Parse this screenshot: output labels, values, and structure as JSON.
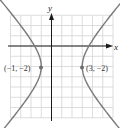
{
  "chart_data": {
    "type": "line",
    "title": "",
    "xlabel": "x",
    "ylabel": "y",
    "xlim": [
      -4,
      6
    ],
    "ylim": [
      -7,
      3
    ],
    "grid": true,
    "curve": "hyperbola",
    "series": [
      {
        "name": "left-branch",
        "color": "#7a7a7a"
      },
      {
        "name": "right-branch",
        "color": "#7a7a7a"
      }
    ],
    "points": [
      {
        "x": -1,
        "y": -2,
        "label": "(−1, −2)"
      },
      {
        "x": 3,
        "y": -2,
        "label": "(3, −2)"
      }
    ]
  },
  "labels": {
    "x_axis": "x",
    "y_axis": "y",
    "vertex_left": "(−1, −2)",
    "vertex_right": "(3, −2)"
  },
  "colors": {
    "grid": "#d4d4d4",
    "axis": "#1a1a1a",
    "curve": "#7a7a7a",
    "point": "#6e6e6e"
  }
}
